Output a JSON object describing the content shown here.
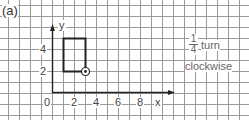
{
  "figure": {
    "part_label": "(a)",
    "axes": {
      "x_label": "x",
      "y_label": "y",
      "x_ticks": [
        "0",
        "2",
        "4",
        "6",
        "8"
      ],
      "y_ticks": [
        "2",
        "4"
      ]
    },
    "shape": {
      "type": "rectangle",
      "vertices": [
        [
          1,
          2
        ],
        [
          3,
          2
        ],
        [
          3,
          5
        ],
        [
          1,
          5
        ]
      ],
      "centre_of_rotation": [
        3,
        2
      ]
    },
    "instruction": {
      "fraction_numerator": "1",
      "fraction_denominator": "4",
      "turn_label": "turn",
      "direction": "clockwise"
    }
  }
}
